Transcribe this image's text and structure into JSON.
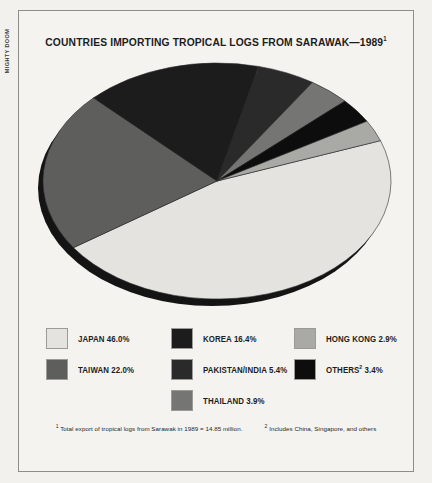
{
  "edge_caption": "MIGHTY DOOM",
  "chart_title_main": "COUNTRIES IMPORTING TROPICAL LOGS FROM SARAWAK—1989",
  "chart_title_marker": "1",
  "legend": {
    "columns": [
      [
        {
          "label": "JAPAN 46.0%",
          "marker": "",
          "color": "#e4e3df"
        },
        {
          "label": "TAIWAN 22.0%",
          "marker": "",
          "color": "#5e5e5c"
        }
      ],
      [
        {
          "label": "KOREA 16.4%",
          "marker": "",
          "color": "#1c1c1c"
        },
        {
          "label": "PAKISTAN/INDIA 5.4%",
          "marker": "",
          "color": "#2a2a2a"
        },
        {
          "label": "THAILAND 3.9%",
          "marker": "",
          "color": "#757573"
        }
      ],
      [
        {
          "label": "HONG KONG 2.9%",
          "marker": "",
          "color": "#a9a9a6"
        },
        {
          "label": "OTHERS 3.4%",
          "marker": "2",
          "color": "#0d0d0d"
        }
      ]
    ]
  },
  "footnotes": [
    {
      "marker": "1",
      "text": "Total export of tropical logs from Sarawak in 1989 = 14.85 million."
    },
    {
      "marker": "2",
      "text": "Includes China, Singapore, and others"
    }
  ],
  "chart_data": {
    "type": "pie",
    "title": "COUNTRIES IMPORTING TROPICAL LOGS FROM SARAWAK—1989",
    "units": "percent of total export volume",
    "total_note": "Total export of tropical logs from Sarawak in 1989 = 14.85 million.",
    "legend_position": "bottom",
    "grid": false,
    "start_angle_deg": -20,
    "direction": "clockwise",
    "labels": [
      "JAPAN",
      "TAIWAN",
      "KOREA",
      "PAKISTAN/INDIA",
      "THAILAND",
      "OTHERS",
      "HONG KONG"
    ],
    "values": [
      46.0,
      22.0,
      16.4,
      5.4,
      3.9,
      3.4,
      2.9
    ],
    "slices": [
      {
        "label": "JAPAN",
        "value": 46.0,
        "color": "#e4e3df"
      },
      {
        "label": "TAIWAN",
        "value": 22.0,
        "color": "#5e5e5c"
      },
      {
        "label": "KOREA",
        "value": 16.4,
        "color": "#1c1c1c"
      },
      {
        "label": "PAKISTAN/INDIA",
        "value": 5.4,
        "color": "#2a2a2a"
      },
      {
        "label": "THAILAND",
        "value": 3.9,
        "color": "#757573"
      },
      {
        "label": "OTHERS",
        "value": 3.4,
        "color": "#0d0d0d"
      },
      {
        "label": "HONG KONG",
        "value": 2.9,
        "color": "#a9a9a6"
      }
    ]
  },
  "pie_geometry": {
    "cx": 186,
    "cy": 128,
    "rx": 174,
    "ry": 118,
    "rim_color": "#141414",
    "rim_offset_x": -5,
    "rim_offset_y": 7
  }
}
